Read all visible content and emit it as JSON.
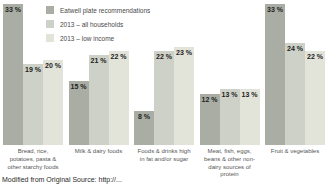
{
  "chart_data": {
    "type": "bar",
    "title": "",
    "xlabel": "",
    "ylabel": "",
    "value_suffix": " %",
    "ylim": [
      0,
      35
    ],
    "grid": false,
    "legend_position": "top-left",
    "bar_label_position": "inside-top",
    "categories": [
      "Bread, rice, potatoes, pasta & other starchy foods",
      "Milk & dairy foods",
      "Foods & drinks high in fat and/or sugar",
      "Meat, fish, eggs, beans & other non-dairy sources of protein",
      "Fruit & vegetables"
    ],
    "series": [
      {
        "name": "Eatwell plate recommendations",
        "color": "#a9ada3",
        "values": [
          33,
          15,
          8,
          12,
          33
        ]
      },
      {
        "name": "2013 – all households",
        "color": "#ced1c7",
        "values": [
          19,
          21,
          22,
          13,
          24
        ]
      },
      {
        "name": "2013 – low income",
        "color": "#e2e3d9",
        "values": [
          20,
          22,
          23,
          13,
          22
        ]
      }
    ]
  },
  "caption": "Modified from Original Source: http://...",
  "colors": {
    "background": "#ffffff",
    "value_label_text": "#222222",
    "legend_text": "#4a4a4a",
    "category_text": "#565656"
  }
}
